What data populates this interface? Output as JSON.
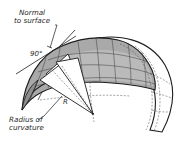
{
  "diagram": {
    "labels": {
      "normal_line1": "Normal",
      "normal_line2": "to surface",
      "angle": "90°",
      "radius_symbol": "R",
      "radius_line1": "Radius of",
      "radius_line2": "curvature"
    },
    "colors": {
      "shell_shade": "#a9a9a9",
      "inner_shade": "#c4c4c4",
      "outline": "#1c1c1c",
      "background": "#ffffff",
      "wedge_fill": "#ffffff"
    }
  }
}
